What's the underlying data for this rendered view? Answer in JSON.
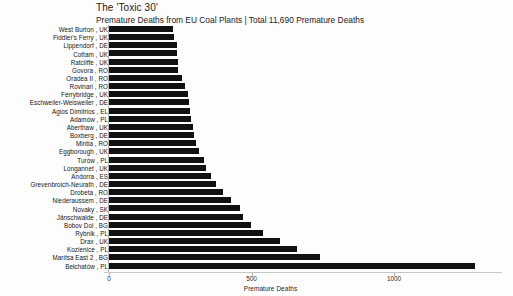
{
  "chart_data": {
    "type": "bar",
    "orientation": "horizontal",
    "title": "The 'Toxic 30'",
    "subtitle": "Premature Deaths from EU Coal Plants | Total 11,690 Premature Deaths",
    "xlabel": "Premature Deaths",
    "ylabel": "",
    "xlim": [
      0,
      1400
    ],
    "xticks": [
      0,
      500,
      1000
    ],
    "xtick_labels": [
      "0",
      "500",
      "1000"
    ],
    "grid": false,
    "legend": false,
    "bar_color": "#111111",
    "categories": [
      "West Burton , UK",
      "Fiddler's Ferry , UK",
      "Lippendorf , DE",
      "Cottam , UK",
      "Ratcliffe , UK",
      "Govora , RO",
      "Oradea II , RO",
      "Rovinari , RO",
      "Ferrybridge , UK",
      "Eschweiler-Weisweiler , DE",
      "Agios Dimitrios , EL",
      "Adamów , PL",
      "Aberthaw , UK",
      "Boxberg , DE",
      "Mintia , RO",
      "Eggborough , UK",
      "Turów , PL",
      "Longannet , UK",
      "Andorra , ES",
      "Grevenbroich-Neurath , DE",
      "Drobeta , RO",
      "Niederaussem , DE",
      "Novaky , SK",
      "Jänschwalde , DE",
      "Bobov Dol , BG",
      "Rybnik , PL",
      "Drax , UK",
      "Kozienice , PL",
      "Maritsa East 2 , BG",
      "Bełchatów , PL"
    ],
    "values": [
      225,
      227,
      239,
      240,
      241,
      243,
      256,
      267,
      277,
      281,
      284,
      288,
      295,
      298,
      305,
      316,
      333,
      340,
      358,
      375,
      400,
      428,
      460,
      470,
      498,
      540,
      600,
      660,
      740,
      1284
    ]
  }
}
